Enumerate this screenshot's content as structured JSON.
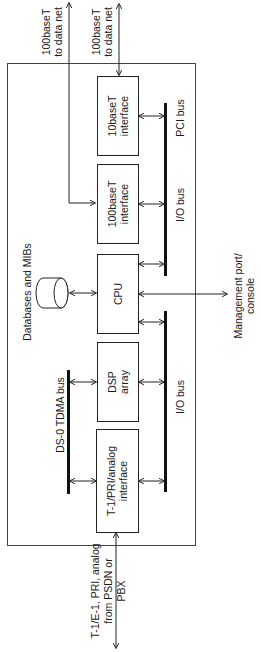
{
  "diagram": {
    "outer_label": "",
    "blocks": {
      "tenbaset": {
        "line1": "10baseT",
        "line2": "interface"
      },
      "hundredbaset": {
        "line1": "100baseT",
        "line2": "interface"
      },
      "cpu": {
        "line1": "CPU"
      },
      "dsp": {
        "line1": "DSP",
        "line2": "array"
      },
      "t1": {
        "line1": "T-1/PRI/analog",
        "line2": "interface"
      }
    },
    "database": {
      "label": "Databases and MIBs"
    },
    "buses": {
      "pci": "PCI bus",
      "io_upper": "I/O bus",
      "io_lower": "I/O bus",
      "tdma": "DS-0 TDMA bus"
    },
    "external": {
      "net_left": {
        "line1": "100baseT",
        "line2": "to data net"
      },
      "net_right": {
        "line1": "100baseT",
        "line2": "to data net"
      },
      "management": {
        "line1": "Management port/",
        "line2": "console"
      },
      "pstn": {
        "line1": "T-1/E-1, PRI, analog",
        "line2": "from PSDN or",
        "line3": "PBX"
      }
    }
  }
}
